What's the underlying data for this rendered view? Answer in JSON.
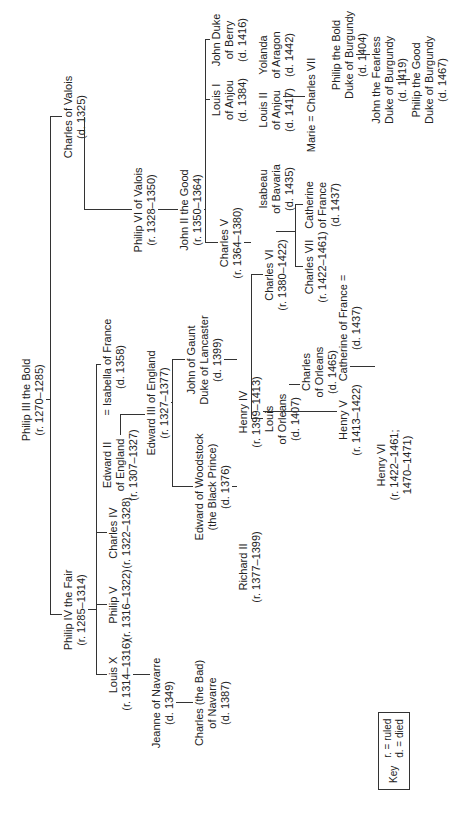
{
  "people": {
    "philip3": {
      "name": "Philip III the Bold",
      "dates": "(r. 1270–1285)"
    },
    "philip4": {
      "name": "Philip IV the Fair",
      "dates": "(r. 1285–1314)"
    },
    "charles_valois": {
      "name": "Charles of Valois",
      "dates": "(d. 1325)"
    },
    "louis10": {
      "name": "Louis X",
      "dates": "(r. 1314–1316)"
    },
    "philip5": {
      "name": "Philip V",
      "dates": "(r. 1316–1322)"
    },
    "charles4": {
      "name": "Charles IV",
      "dates": "(r. 1322–1328)"
    },
    "edward2": {
      "name": "Edward II",
      "line2": "of England",
      "dates": "(r. 1307–1327)"
    },
    "isabella": {
      "name": "= Isabella of France",
      "dates": "(d. 1358)"
    },
    "jeanne": {
      "name": "Jeanne of Navarre",
      "dates": "(d. 1349)"
    },
    "charles_bad": {
      "name": "Charles (the Bad)",
      "line2": "of Navarre",
      "dates": "(d. 1387)"
    },
    "edward3": {
      "name": "Edward III of England",
      "dates": "(r. 1327–1377)"
    },
    "black_prince": {
      "name": "Edward of Woodstock",
      "line2": "(the Black Prince)",
      "dates": "(d. 1376)"
    },
    "john_gaunt": {
      "name": "John of Gaunt",
      "line2": "Duke of Lancaster",
      "dates": "(d. 1399)"
    },
    "richard2": {
      "name": "Richard II",
      "dates": "(r. 1377–1399)"
    },
    "henry4": {
      "name": "Henry IV",
      "dates": "(r. 1399–1413)"
    },
    "catherine_eng": {
      "name": "Catherine of France =",
      "dates": "(d. 1437)"
    },
    "henry5": {
      "name": "Henry V",
      "dates": "(r. 1413–1422)"
    },
    "henry6": {
      "name": "Henry VI",
      "dates": "(r. 1422–1461;",
      "line3": "1470–1471)"
    },
    "philip6": {
      "name": "Philip VI of Valois",
      "dates": "(r. 1328–1350)"
    },
    "john2": {
      "name": "John II the Good",
      "dates": "(r. 1350–1364)"
    },
    "charles5": {
      "name": "Charles V",
      "dates": "(r. 1364–1380)"
    },
    "louis_anjou1": {
      "name": "Louis I",
      "line2": "of Anjou",
      "dates": "(d. 1384)"
    },
    "john_berry": {
      "name": "John Duke",
      "line2": "of Berry",
      "dates": "(d. 1416)"
    },
    "philip_bold_burg": {
      "name": "Philip the Bold",
      "line2": "Duke of Burgundy",
      "dates": "(d. 1404)"
    },
    "charles6": {
      "name": "Charles VI",
      "dates": "(r. 1380–1422)"
    },
    "isabeau": {
      "name": "Isabeau",
      "line2": "of Bavaria",
      "dates": "(d. 1435)"
    },
    "louis_orleans": {
      "name": "Louis",
      "line2": "of Orleans",
      "dates": "(d. 1407)"
    },
    "charles_orleans": {
      "name": "Charles",
      "line2": "of Orleans",
      "dates": "(d. 1465)"
    },
    "louis_anjou2": {
      "name": "Louis II",
      "line2": "of Anjou",
      "dates": "(d. 1417)"
    },
    "yolanda": {
      "name": "Yolanda",
      "line2": "of Aragon",
      "dates": "(d. 1442)"
    },
    "john_fearless": {
      "name": "John the Fearless",
      "line2": "Duke of Burgundy",
      "dates": "(d. 1419)"
    },
    "philip_good": {
      "name": "Philip the Good",
      "line2": "Duke of Burgundy",
      "dates": "(d. 1467)"
    },
    "charles7": {
      "name": "Charles VII",
      "dates": "(r. 1422–1461)"
    },
    "catherine_fr": {
      "name": "Catherine",
      "line2": "of France",
      "dates": "(d. 1437)"
    },
    "marie_charles7": {
      "name": "Marie = Charles VII"
    }
  },
  "marriage_signs": {
    "eq": "="
  },
  "key": {
    "label": "Key",
    "r": "r. = ruled",
    "d": "d. = died"
  }
}
